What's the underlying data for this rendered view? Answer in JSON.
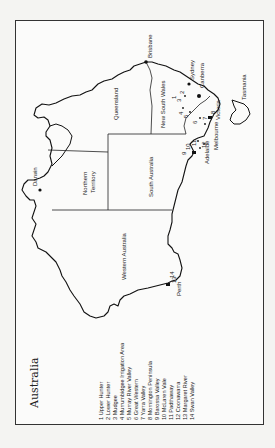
{
  "map": {
    "title": "Australia",
    "orientation": "rotated 90° counter-clockwise (north faces left)",
    "states": [
      {
        "name": "Queensland"
      },
      {
        "name": "New South Wales"
      },
      {
        "name": "Victoria"
      },
      {
        "name": "Tasmania"
      },
      {
        "name": "South Australia"
      },
      {
        "name": "Northern Territory",
        "line1": "Northern",
        "line2": "Territory"
      },
      {
        "name": "Western Australia"
      }
    ],
    "cities": [
      {
        "name": "Brisbane"
      },
      {
        "name": "Sydney"
      },
      {
        "name": "Canberra"
      },
      {
        "name": "Melbourne"
      },
      {
        "name": "Adelaide"
      },
      {
        "name": "Perth"
      },
      {
        "name": "Darwin"
      }
    ],
    "region_markers": [
      "1",
      "2",
      "3",
      "4",
      "5",
      "6",
      "7",
      "8",
      "9",
      "10",
      "11",
      "12",
      "13",
      "14"
    ],
    "legend": [
      "1 Upper Hunter",
      "2 Lower Hunter",
      "3 Mudgee",
      "4 Murrumbidgee Irrigation Area",
      "5 Murray River Valley",
      "6 Great Western",
      "7 Yarra Valley",
      "8 Mornington Peninsula",
      "9 Barossa Valley",
      "10 McLaren Vale",
      "11 Padthaway",
      "12 Coonawarra",
      "13 Margaret River",
      "14 Swan Valley"
    ]
  }
}
